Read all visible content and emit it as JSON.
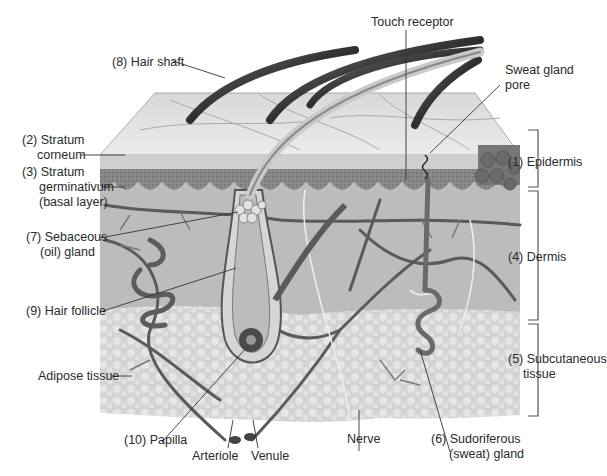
{
  "figure": {
    "colors": {
      "background": "#ffffff",
      "skin_surface": "#e4e4e4",
      "epidermis_dark": "#7a7a7a",
      "dermis": "#bdbdbd",
      "subcutaneous": "#d6d6d6",
      "hair": "#4a4a4a",
      "vessel": "#5a5a5a",
      "leader_line": "#333333",
      "text": "#2a2a2a"
    }
  },
  "labels": {
    "hair_shaft": "(8) Hair shaft",
    "touch_receptor": "Touch receptor",
    "sweat_gland_pore_1": "Sweat gland",
    "sweat_gland_pore_2": "pore",
    "stratum_corneum_1": "(2) Stratum",
    "stratum_corneum_2": "corneum",
    "stratum_germ_1": "(3) Stratum",
    "stratum_germ_2": "germinativum",
    "stratum_germ_3": "(basal layer)",
    "sebaceous_1": "(7) Sebaceous",
    "sebaceous_2": "(oil) gland",
    "hair_follicle": "(9) Hair follicle",
    "adipose": "Adipose tissue",
    "papilla": "(10) Papilla",
    "arteriole": "Arteriole",
    "venule": "Venule",
    "nerve": "Nerve",
    "sudoriferous_1": "(6) Sudoriferous",
    "sudoriferous_2": "(sweat) gland",
    "epidermis": "(1) Epidermis",
    "dermis": "(4) Dermis",
    "subcutaneous_1": "(5) Subcutaneous",
    "subcutaneous_2": "tissue"
  }
}
